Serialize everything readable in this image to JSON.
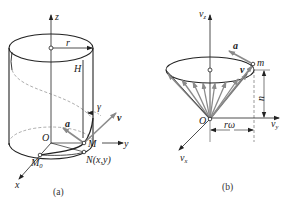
{
  "figure_a": {
    "caption": "(a)",
    "labels": {
      "z_axis": "z",
      "y_axis": "y",
      "x_axis": "x",
      "origin": "O",
      "radius": "r",
      "height": "H",
      "angle": "γ",
      "velocity": "v",
      "acceleration": "a",
      "point_m": "M",
      "point_n": "N(x,y)",
      "point_m0": "M",
      "point_m0_sub": "0"
    }
  },
  "figure_b": {
    "caption": "(b)",
    "labels": {
      "vz_axis": "v",
      "vz_sub": "z",
      "vy_axis": "v",
      "vy_sub": "y",
      "vx_axis": "v",
      "vx_sub": "x",
      "origin": "O",
      "acceleration": "a",
      "velocity": "v",
      "point_m": "m",
      "height": "u",
      "radius": "rω"
    }
  },
  "colors": {
    "line": "#222222",
    "vector_gray": "#8a8a8a",
    "dashed": "#777777"
  }
}
